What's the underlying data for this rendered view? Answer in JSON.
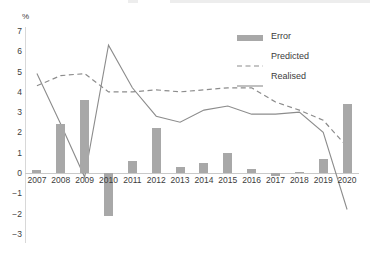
{
  "axis": {
    "y_unit_label": "%",
    "y_ticks": [
      "7",
      "6",
      "5",
      "4",
      "3",
      "2",
      "1",
      "0",
      "−1",
      "−2",
      "−3"
    ],
    "x_ticks": [
      "2007",
      "2008",
      "2009",
      "2010",
      "2011",
      "2012",
      "2013",
      "2014",
      "2015",
      "2016",
      "2017",
      "2018",
      "2019",
      "2020"
    ]
  },
  "legend": {
    "items": [
      {
        "label": "Error",
        "key": "bar",
        "color": "#a8a8a8"
      },
      {
        "label": "Predicted",
        "key": "dashed-line",
        "color": "#8c8c8c"
      },
      {
        "label": "Realised",
        "key": "solid-line",
        "color": "#8c8c8c"
      }
    ]
  },
  "colors": {
    "bar": "#a8a8a8",
    "line": "#8c8c8c",
    "axis": "#d8d8d8",
    "text": "#3c3c3c"
  },
  "chart_data": {
    "type": "bar",
    "title": "",
    "subtitle": "",
    "xlabel": "",
    "ylabel": "%",
    "ylim": [
      -3,
      7
    ],
    "yticks": [
      -3,
      -2,
      -1,
      0,
      1,
      2,
      3,
      4,
      5,
      6,
      7
    ],
    "grid": false,
    "legend_position": "top-right",
    "categories": [
      "2007",
      "2008",
      "2009",
      "2010",
      "2011",
      "2012",
      "2013",
      "2014",
      "2015",
      "2016",
      "2017",
      "2018",
      "2019",
      "2020"
    ],
    "series": [
      {
        "name": "Error",
        "type": "bar",
        "color": "#a8a8a8",
        "values": [
          0.15,
          2.4,
          3.6,
          -2.1,
          0.6,
          2.2,
          0.3,
          0.5,
          1.0,
          0.2,
          -0.15,
          0.05,
          0.7,
          3.4
        ]
      },
      {
        "name": "Predicted",
        "type": "line",
        "style": "dashed",
        "color": "#8c8c8c",
        "values": [
          4.3,
          4.8,
          4.9,
          4.0,
          4.0,
          4.1,
          4.0,
          4.1,
          4.2,
          4.2,
          3.5,
          3.1,
          2.6,
          1.3
        ]
      },
      {
        "name": "Realised",
        "type": "line",
        "style": "solid",
        "color": "#8c8c8c",
        "values": [
          4.9,
          2.4,
          -0.2,
          6.3,
          4.2,
          2.8,
          2.5,
          3.1,
          3.3,
          2.9,
          2.9,
          3.0,
          2.0,
          -1.8
        ]
      }
    ]
  }
}
